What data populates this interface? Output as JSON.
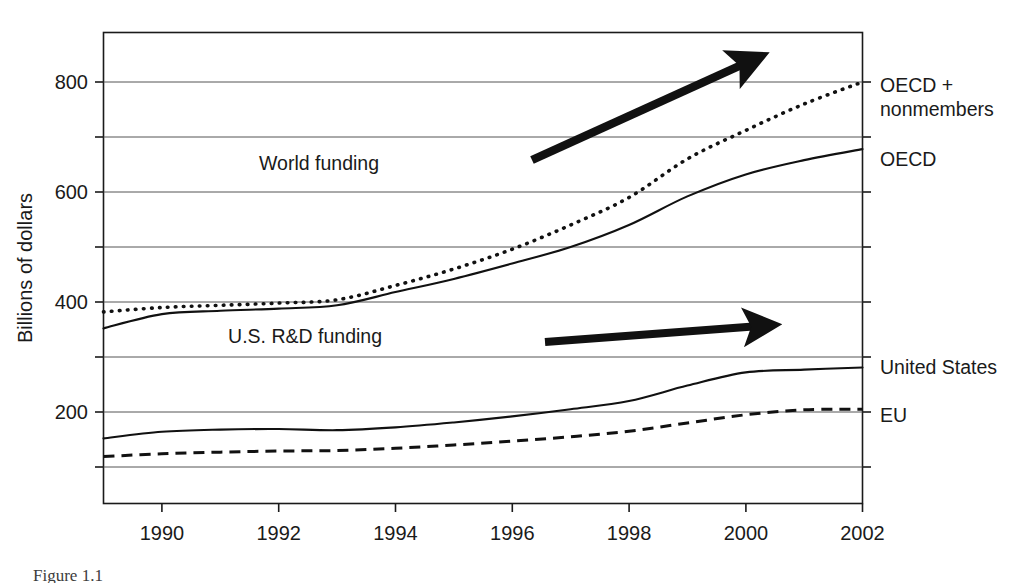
{
  "figure": {
    "caption": "Figure 1.1"
  },
  "chart_data": {
    "type": "line",
    "title": "",
    "xlabel": "",
    "ylabel": "Billions of dollars",
    "xlim": [
      1989,
      2002
    ],
    "ylim": [
      0,
      870
    ],
    "grid": true,
    "gridlines_y": [
      100,
      200,
      300,
      400,
      500,
      600,
      700,
      800
    ],
    "y_ticks_labeled": [
      200,
      400,
      600,
      800
    ],
    "y_tick_labels": [
      "200",
      "400",
      "600",
      "800"
    ],
    "x_ticks_labeled": [
      1990,
      1992,
      1994,
      1996,
      1998,
      2000,
      2002
    ],
    "x_tick_labels": [
      "1990",
      "1992",
      "1994",
      "1996",
      "1998",
      "2000",
      "2002"
    ],
    "x_minor_ticks": [
      1989,
      1991,
      1993,
      1995,
      1997,
      1999,
      2001
    ],
    "legend_position": "right-of-axes",
    "x": [
      1989,
      1990,
      1991,
      1992,
      1993,
      1994,
      1995,
      1996,
      1997,
      1998,
      1999,
      2000,
      2001,
      2002
    ],
    "series": [
      {
        "name": "OECD + nonmembers",
        "label": "OECD +\nnonmembers",
        "style": "dotted",
        "color": "#111111",
        "values": [
          382,
          390,
          394,
          398,
          404,
          430,
          460,
          496,
          540,
          590,
          660,
          712,
          760,
          800
        ]
      },
      {
        "name": "OECD",
        "label": "OECD",
        "style": "solid",
        "color": "#111111",
        "values": [
          352,
          378,
          384,
          388,
          394,
          418,
          442,
          470,
          500,
          540,
          592,
          632,
          658,
          678
        ]
      },
      {
        "name": "United States",
        "label": "United States",
        "style": "solid",
        "color": "#111111",
        "values": [
          152,
          164,
          168,
          169,
          167,
          172,
          181,
          192,
          205,
          220,
          248,
          272,
          277,
          281
        ]
      },
      {
        "name": "EU",
        "label": "EU",
        "style": "dashed",
        "color": "#111111",
        "values": [
          119,
          124,
          127,
          129,
          130,
          134,
          140,
          147,
          155,
          165,
          180,
          195,
          204,
          205
        ]
      }
    ],
    "annotations": [
      {
        "name": "world-funding",
        "text": "World funding",
        "arrow": "diagonal-up-right"
      },
      {
        "name": "us-rd-funding",
        "text": "U.S. R&D funding",
        "arrow": "horizontal-right"
      }
    ]
  }
}
